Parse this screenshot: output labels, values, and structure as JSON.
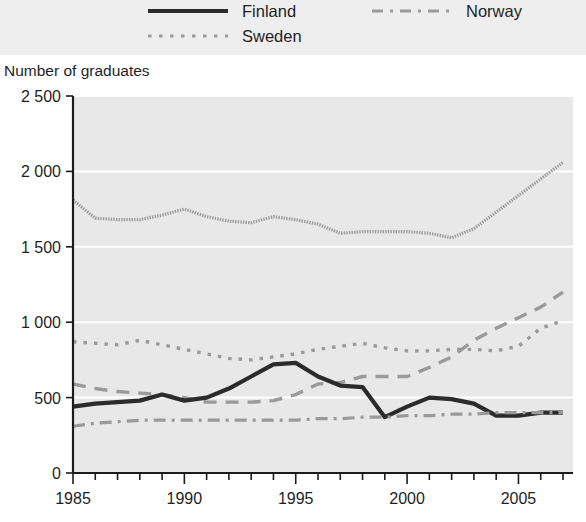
{
  "legend": {
    "position": "top",
    "items": [
      {
        "key": "finland",
        "label": "Finland",
        "style": "solid",
        "color": "#2b2b2b"
      },
      {
        "key": "norway",
        "label": "Norway",
        "style": "dashdot",
        "color": "#9a9a9a"
      },
      {
        "key": "sweden",
        "label": "Sweden",
        "style": "dotted",
        "color": "#9a9a9a"
      }
    ]
  },
  "axis": {
    "ylabel": "Number of graduates",
    "yticks": [
      "0",
      "500",
      "1 000",
      "1 500",
      "2 000",
      "2 500"
    ],
    "ytick_values": [
      0,
      500,
      1000,
      1500,
      2000,
      2500
    ],
    "xticks": [
      "1985",
      "1990",
      "1995",
      "2000",
      "2005"
    ],
    "xtick_values": [
      1985,
      1990,
      1995,
      2000,
      2005
    ]
  },
  "chart_data": {
    "type": "line",
    "title": "",
    "xlabel": "",
    "ylabel": "Number of graduates",
    "xlim": [
      1985,
      2007
    ],
    "ylim": [
      0,
      2500
    ],
    "grid": true,
    "legend_position": "top",
    "x": [
      1985,
      1986,
      1987,
      1988,
      1989,
      1990,
      1991,
      1992,
      1993,
      1994,
      1995,
      1996,
      1997,
      1998,
      1999,
      2000,
      2001,
      2002,
      2003,
      2004,
      2005,
      2006,
      2007
    ],
    "series": [
      {
        "name": "Denmark",
        "style": "fine-dotted",
        "color": "#9a9a9a",
        "in_legend": false,
        "values": [
          1810,
          1690,
          1680,
          1680,
          1710,
          1750,
          1700,
          1670,
          1660,
          1700,
          1680,
          1650,
          1590,
          1600,
          1600,
          1600,
          1590,
          1560,
          1620,
          1730,
          1840,
          1950,
          2060
        ]
      },
      {
        "name": "Sweden",
        "style": "dotted",
        "color": "#9a9a9a",
        "in_legend": true,
        "values": [
          870,
          860,
          850,
          880,
          850,
          820,
          790,
          760,
          750,
          770,
          790,
          820,
          840,
          860,
          830,
          810,
          810,
          820,
          820,
          810,
          840,
          960,
          1010
        ]
      },
      {
        "name": "Norway",
        "style": "dashed",
        "color": "#9a9a9a",
        "in_legend": true,
        "values": [
          590,
          560,
          540,
          530,
          520,
          500,
          470,
          470,
          470,
          480,
          520,
          590,
          600,
          640,
          640,
          640,
          700,
          770,
          880,
          960,
          1030,
          1100,
          1200
        ]
      },
      {
        "name": "Finland",
        "style": "solid",
        "color": "#2b2b2b",
        "in_legend": true,
        "values": [
          440,
          460,
          470,
          480,
          520,
          480,
          500,
          560,
          640,
          720,
          730,
          640,
          580,
          570,
          370,
          440,
          500,
          490,
          460,
          380,
          380,
          400,
          400
        ]
      },
      {
        "name": "Iceland",
        "style": "dashdot",
        "color": "#9a9a9a",
        "in_legend": false,
        "values": [
          310,
          330,
          340,
          350,
          350,
          350,
          350,
          350,
          350,
          350,
          350,
          360,
          360,
          370,
          370,
          380,
          380,
          390,
          390,
          400,
          400,
          400,
          400
        ]
      }
    ]
  }
}
